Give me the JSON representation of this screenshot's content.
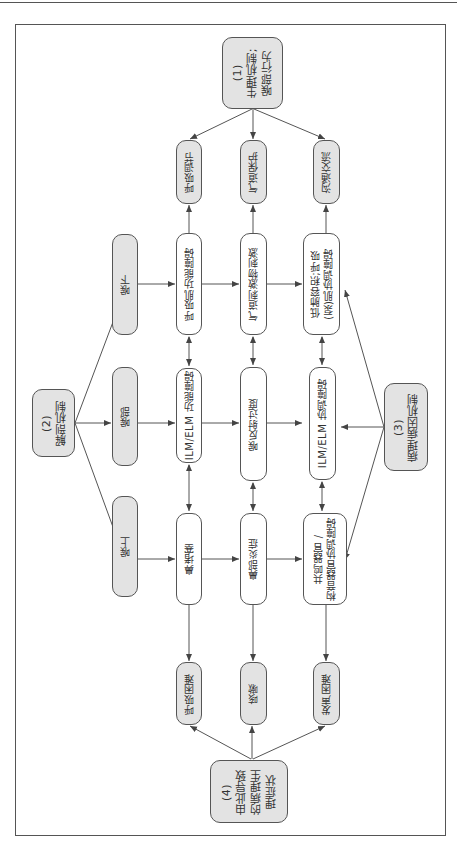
{
  "diagram": {
    "orientation": "rotated-90-clockwise",
    "colors": {
      "gray_fill": "#e3e3e3",
      "border": "#555555",
      "arrow": "#555555"
    },
    "groups": {
      "g1": {
        "label": "(1)\n生理机制;\n喉部行为"
      },
      "g2": {
        "label": "(2)\n解剖机制"
      },
      "g3": {
        "label": "(3)\n病理病因机制"
      },
      "g4": {
        "label": "(4)\n由此导致\n的病理生\n理症状"
      }
    },
    "functions": [
      {
        "label": "呼吸调节"
      },
      {
        "label": "气道保护"
      },
      {
        "label": "沟通交流"
      }
    ],
    "anatomy": [
      {
        "label": "喉下"
      },
      {
        "label": "喉部"
      },
      {
        "label": "喉上"
      }
    ],
    "mechanisms": {
      "row_lower": [
        {
          "label": "呼吸肌功能障碍"
        },
        {
          "label": "气道刺激物刺激"
        },
        {
          "label": "低肺容积;呼吸\n(泵)肌协调障碍"
        }
      ],
      "row_larynx": [
        {
          "label": "ILM/ELM 功能障碍"
        },
        {
          "label": "喉反射过度"
        },
        {
          "label": "ILM/ELM 协调障碍"
        }
      ],
      "row_upper": [
        {
          "label": "鼻堵塞"
        },
        {
          "label": "鼻部炎症"
        },
        {
          "label": "共鸣器官 /\n构音器官协调障碍"
        }
      ]
    },
    "symptoms": [
      {
        "label": "呼吸困难"
      },
      {
        "label": "咳嗽"
      },
      {
        "label": "发声困难"
      }
    ]
  }
}
